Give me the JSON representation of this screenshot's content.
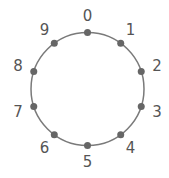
{
  "diagram": {
    "type": "circular-number-ring",
    "circle_color": "#7a7a7a",
    "dot_color": "#666666",
    "label_color": "#555555",
    "nodes": [
      {
        "label": "0"
      },
      {
        "label": "1"
      },
      {
        "label": "2"
      },
      {
        "label": "3"
      },
      {
        "label": "4"
      },
      {
        "label": "5"
      },
      {
        "label": "6"
      },
      {
        "label": "7"
      },
      {
        "label": "8"
      },
      {
        "label": "9"
      }
    ]
  }
}
